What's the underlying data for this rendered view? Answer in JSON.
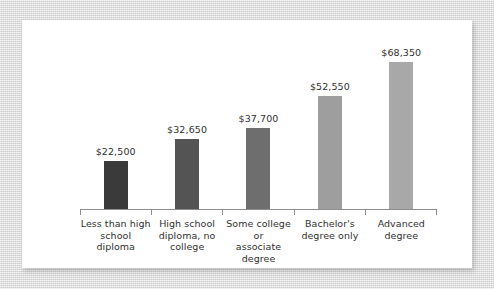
{
  "chart_data": {
    "type": "bar",
    "title": "",
    "subtitle": "",
    "xlabel": "",
    "ylabel": "",
    "grid": false,
    "legend": "none",
    "ylim": [
      0,
      75000
    ],
    "categories": [
      "Less than high school diploma",
      "High school diploma, no college",
      "Some college or associate degree",
      "Bachelor's degree only",
      "Advanced degree"
    ],
    "category_lines": [
      [
        "Less than high",
        "school diploma"
      ],
      [
        "High school",
        "diploma, no",
        "college"
      ],
      [
        "Some college or",
        "associate",
        "degree"
      ],
      [
        "Bachelor's",
        "degree only"
      ],
      [
        "Advanced",
        "degree"
      ]
    ],
    "values": [
      22500,
      32650,
      37700,
      52550,
      68350
    ],
    "value_labels": [
      "$22,500",
      "$32,650",
      "$37,700",
      "$52,550",
      "$68,350"
    ],
    "bar_colors": [
      "#3a3a3a",
      "#545454",
      "#6e6e6e",
      "#9e9e9e",
      "#a8a8a8"
    ]
  },
  "style": {
    "panel_background": "#ffffff",
    "page_background": "#dcdcdc",
    "axis_color": "#8d8d8d",
    "text_color": "#2f2f2f"
  }
}
